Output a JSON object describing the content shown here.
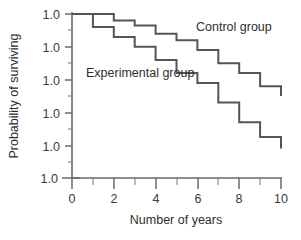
{
  "chart_data": {
    "type": "line",
    "subtype": "step",
    "title": "",
    "xlabel": "Number of years",
    "ylabel": "Probability of surviving",
    "xlim": [
      0,
      10
    ],
    "ylim": [
      0.0,
      1.0
    ],
    "grid": false,
    "legend_position": "inline-annotation",
    "x_ticks": [
      0,
      2,
      4,
      6,
      8,
      10
    ],
    "x_tick_labels": [
      "0",
      "2",
      "4",
      "6",
      "8",
      "10"
    ],
    "x_minor_ticks": [
      1,
      3,
      5,
      7,
      9
    ],
    "y_ticks": [
      1.0,
      0.8,
      0.6,
      0.4,
      0.2,
      0.0
    ],
    "y_tick_labels": [
      "1.0",
      "1.0",
      "1.0",
      "1.0",
      "1.0",
      "1.0"
    ],
    "series": [
      {
        "name": "Control group",
        "color": "#555555",
        "x": [
          0,
          1,
          2,
          3,
          4,
          5,
          6,
          7,
          8,
          9,
          10
        ],
        "values": [
          1.0,
          1.0,
          0.96,
          0.93,
          0.88,
          0.84,
          0.78,
          0.7,
          0.64,
          0.56,
          0.5
        ]
      },
      {
        "name": "Experimental group",
        "color": "#555555",
        "x": [
          0,
          1,
          2,
          3,
          4,
          5,
          6,
          7,
          8,
          9,
          10
        ],
        "values": [
          1.0,
          0.92,
          0.86,
          0.8,
          0.72,
          0.64,
          0.58,
          0.46,
          0.34,
          0.25,
          0.18
        ]
      }
    ],
    "annotations": [
      {
        "text": "Control group",
        "x": 7.0,
        "y": 0.9
      },
      {
        "text": "Experimental group",
        "x": 2.2,
        "y": 0.6
      }
    ]
  },
  "colors": {
    "line": "#555555",
    "axis": "#6a6a6a",
    "text": "#2e2e2e",
    "background": "#ffffff"
  }
}
